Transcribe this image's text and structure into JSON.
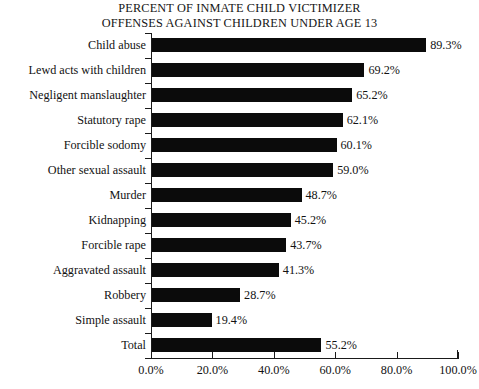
{
  "chart_data": {
    "type": "bar",
    "orientation": "horizontal",
    "title": "PERCENT OF INMATE CHILD VICTIMIZER OFFENSES AGAINST CHILDREN UNDER AGE 13",
    "title_lines": [
      "PERCENT OF INMATE CHILD VICTIMIZER",
      "OFFENSES AGAINST CHILDREN UNDER AGE 13"
    ],
    "xlabel": "",
    "ylabel": "",
    "xlim": [
      0,
      100
    ],
    "grid": false,
    "legend": false,
    "bar_color": "#0b0b0b",
    "categories": [
      "Child abuse",
      "Lewd acts with children",
      "Negligent manslaughter",
      "Statutory rape",
      "Forcible sodomy",
      "Other sexual assault",
      "Murder",
      "Kidnapping",
      "Forcible rape",
      "Aggravated assault",
      "Robbery",
      "Simple assault",
      "Total"
    ],
    "values": [
      89.3,
      69.2,
      65.2,
      62.1,
      60.1,
      59.0,
      48.7,
      45.2,
      43.7,
      41.3,
      28.7,
      19.4,
      55.2
    ],
    "value_labels": [
      "89.3%",
      "69.2%",
      "65.2%",
      "62.1%",
      "60.1%",
      "59.0%",
      "48.7%",
      "45.2%",
      "43.7%",
      "41.3%",
      "28.7%",
      "19.4%",
      "55.2%"
    ],
    "xticks": [
      0,
      20,
      40,
      60,
      80,
      100
    ],
    "xtick_labels": [
      "0.0%",
      "20.0%",
      "40.0%",
      "60.0%",
      "80.0%",
      "100.0%"
    ]
  }
}
